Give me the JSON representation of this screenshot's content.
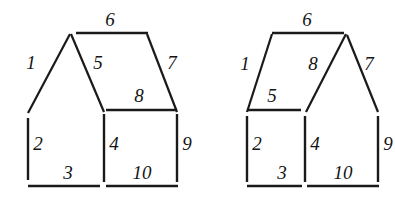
{
  "figure": {
    "background_color": "#ffffff",
    "stroke_color": "#1a1a1a",
    "label_color": "#141414",
    "width": 395,
    "height": 201
  },
  "diagrams": [
    {
      "id": "left-house",
      "name": "left-house-figure",
      "description": "House outline with a peaked roof on the left bay and a sloped roof on the right bay",
      "segments": [
        {
          "label": "1",
          "kind": "diagonal",
          "x1": 28,
          "y1": 113,
          "x2": 70,
          "y2": 34,
          "width": 2.2
        },
        {
          "label": "6",
          "kind": "horizontal",
          "x1": 76,
          "y1": 33,
          "x2": 148,
          "y2": 33,
          "width": 2.6
        },
        {
          "label": "5",
          "kind": "diagonal",
          "x1": 71,
          "y1": 34,
          "x2": 104,
          "y2": 112,
          "width": 2.2
        },
        {
          "label": "7",
          "kind": "diagonal",
          "x1": 147,
          "y1": 34,
          "x2": 177,
          "y2": 112,
          "width": 2.2
        },
        {
          "label": "8",
          "kind": "horizontal",
          "x1": 106,
          "y1": 110,
          "x2": 177,
          "y2": 110,
          "width": 2.4
        },
        {
          "label": "2",
          "kind": "vertical",
          "x1": 28,
          "y1": 118,
          "x2": 28,
          "y2": 180,
          "width": 2.4
        },
        {
          "label": "4",
          "kind": "vertical",
          "x1": 104,
          "y1": 114,
          "x2": 104,
          "y2": 182,
          "width": 2.4
        },
        {
          "label": "9",
          "kind": "vertical",
          "x1": 177,
          "y1": 114,
          "x2": 177,
          "y2": 182,
          "width": 2.4
        },
        {
          "label": "3",
          "kind": "horizontal",
          "x1": 28,
          "y1": 186,
          "x2": 100,
          "y2": 186,
          "width": 2.6
        },
        {
          "label": "10",
          "kind": "horizontal",
          "x1": 106,
          "y1": 186,
          "x2": 178,
          "y2": 186,
          "width": 2.6
        }
      ],
      "labels": [
        {
          "text": "1",
          "x": 31,
          "y": 62
        },
        {
          "text": "6",
          "x": 110,
          "y": 19
        },
        {
          "text": "5",
          "x": 98,
          "y": 62
        },
        {
          "text": "7",
          "x": 172,
          "y": 62
        },
        {
          "text": "8",
          "x": 139,
          "y": 95
        },
        {
          "text": "2",
          "x": 38,
          "y": 143
        },
        {
          "text": "4",
          "x": 114,
          "y": 143
        },
        {
          "text": "9",
          "x": 187,
          "y": 143
        },
        {
          "text": "3",
          "x": 68,
          "y": 172
        },
        {
          "text": "10",
          "x": 142,
          "y": 172
        }
      ]
    },
    {
      "id": "right-house",
      "name": "right-house-figure",
      "description": "Mirrored house outline with a sloped roof on the left bay and a peaked roof on the right bay",
      "segments": [
        {
          "label": "1",
          "kind": "diagonal",
          "x1": 247,
          "y1": 112,
          "x2": 272,
          "y2": 34,
          "width": 2.2
        },
        {
          "label": "6",
          "kind": "horizontal",
          "x1": 272,
          "y1": 33,
          "x2": 344,
          "y2": 33,
          "width": 2.6
        },
        {
          "label": "7",
          "kind": "diagonal",
          "x1": 347,
          "y1": 35,
          "x2": 378,
          "y2": 112,
          "width": 2.2
        },
        {
          "label": "8",
          "kind": "diagonal",
          "x1": 306,
          "y1": 112,
          "x2": 346,
          "y2": 34,
          "width": 2.2
        },
        {
          "label": "5",
          "kind": "horizontal",
          "x1": 247,
          "y1": 110,
          "x2": 301,
          "y2": 110,
          "width": 2.4
        },
        {
          "label": "2",
          "kind": "vertical",
          "x1": 247,
          "y1": 116,
          "x2": 247,
          "y2": 182,
          "width": 2.4
        },
        {
          "label": "4",
          "kind": "vertical",
          "x1": 305,
          "y1": 116,
          "x2": 305,
          "y2": 182,
          "width": 2.4
        },
        {
          "label": "9",
          "kind": "vertical",
          "x1": 378,
          "y1": 116,
          "x2": 378,
          "y2": 182,
          "width": 2.4
        },
        {
          "label": "3",
          "kind": "horizontal",
          "x1": 247,
          "y1": 186,
          "x2": 302,
          "y2": 186,
          "width": 2.6
        },
        {
          "label": "10",
          "kind": "horizontal",
          "x1": 307,
          "y1": 186,
          "x2": 379,
          "y2": 186,
          "width": 2.6
        }
      ],
      "labels": [
        {
          "text": "1",
          "x": 245,
          "y": 63
        },
        {
          "text": "6",
          "x": 307,
          "y": 19
        },
        {
          "text": "5",
          "x": 272,
          "y": 95
        },
        {
          "text": "8",
          "x": 313,
          "y": 63
        },
        {
          "text": "7",
          "x": 369,
          "y": 63
        },
        {
          "text": "2",
          "x": 257,
          "y": 143
        },
        {
          "text": "4",
          "x": 315,
          "y": 143
        },
        {
          "text": "9",
          "x": 388,
          "y": 143
        },
        {
          "text": "3",
          "x": 282,
          "y": 172
        },
        {
          "text": "10",
          "x": 343,
          "y": 172
        }
      ]
    }
  ]
}
